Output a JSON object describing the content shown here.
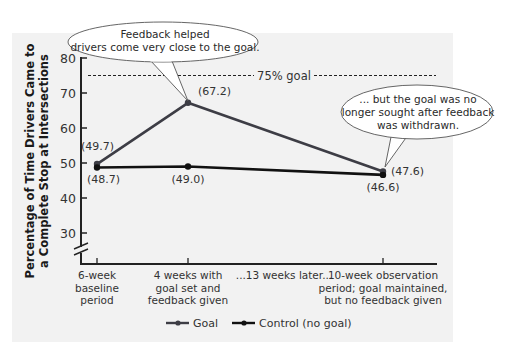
{
  "chart_data": {
    "type": "line",
    "title": "",
    "ylabel": "Percentage of Time Drivers Came to a Complete Stop at Intersections",
    "ylabel_lines": [
      "Percentage of Time Drivers Came to",
      "a Complete Stop at Intersections"
    ],
    "xlabel": "",
    "ylim": [
      26,
      80
    ],
    "yticks": [
      30,
      40,
      50,
      60,
      70,
      80
    ],
    "axis_break": true,
    "grid": false,
    "categories": [
      [
        "6-week",
        "baseline",
        "period"
      ],
      [
        "4 weeks with",
        "goal set and",
        "feedback given"
      ],
      [
        "...13 weeks later..."
      ],
      [
        "10-week observation",
        "period; goal maintained,",
        "but no feedback given"
      ]
    ],
    "category_labels": [
      "6-week baseline period",
      "4 weeks with goal set and feedback given",
      "...13 weeks later...",
      "10-week observation period; goal maintained, but no feedback given"
    ],
    "series": [
      {
        "name": "Goal",
        "color": "#3d3d45",
        "x": [
          0,
          1,
          3
        ],
        "values": [
          49.7,
          67.2,
          47.6
        ],
        "labels": [
          "(49.7)",
          "(67.2)",
          "(47.6)"
        ]
      },
      {
        "name": "Control (no goal)",
        "color": "#111111",
        "x": [
          0,
          1,
          3
        ],
        "values": [
          48.7,
          49.0,
          46.6
        ],
        "labels": [
          "(48.7)",
          "(49.0)",
          "(46.6)"
        ]
      }
    ],
    "reference_line": {
      "value": 75,
      "label": "75% goal",
      "style": "dashed"
    },
    "annotations": [
      {
        "text_lines": [
          "Feedback helped",
          "drivers come very close to the goal."
        ],
        "points_to": "Goal at 4 weeks with goal set and feedback given (67.2)"
      },
      {
        "text_lines": [
          "... but the goal was no",
          "longer sought after feedback",
          "was withdrawn."
        ],
        "points_to": "Goal at 10-week observation period (47.6)"
      }
    ],
    "legend": {
      "position": "bottom",
      "entries": [
        "Goal",
        "Control (no goal)"
      ]
    }
  }
}
